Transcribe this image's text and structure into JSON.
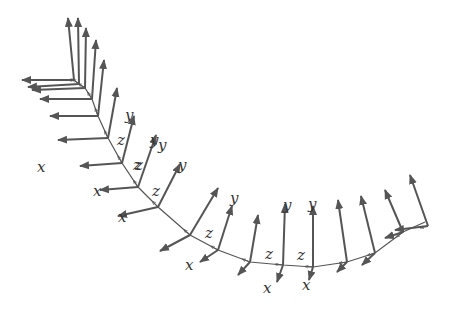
{
  "diagram": {
    "colors": {
      "stroke": "#555555",
      "label": "#333333",
      "background": "#ffffff"
    },
    "curve": [
      [
        74,
        80
      ],
      [
        79,
        84
      ],
      [
        85,
        88
      ],
      [
        92,
        99
      ],
      [
        98,
        116
      ],
      [
        108,
        138
      ],
      [
        122,
        163
      ],
      [
        138,
        187
      ],
      [
        158,
        207
      ],
      [
        190,
        235
      ],
      [
        218,
        250
      ],
      [
        250,
        262
      ],
      [
        283,
        265
      ],
      [
        313,
        267
      ],
      [
        347,
        262
      ],
      [
        375,
        253
      ],
      [
        403,
        232
      ],
      [
        425,
        222
      ]
    ],
    "frames": [
      {
        "o": [
          74,
          80
        ],
        "x": [
          22,
          80
        ],
        "y": [
          68,
          18
        ]
      },
      {
        "o": [
          79,
          84
        ],
        "x": [
          28,
          87
        ],
        "y": [
          78,
          18
        ]
      },
      {
        "o": [
          85,
          88
        ],
        "x": [
          32,
          90
        ],
        "y": [
          86,
          28
        ]
      },
      {
        "o": [
          92,
          99
        ],
        "x": [
          40,
          99
        ],
        "y": [
          96,
          40
        ]
      },
      {
        "o": [
          98,
          116
        ],
        "x": [
          50,
          116
        ],
        "y": [
          104,
          60
        ]
      },
      {
        "o": [
          108,
          138
        ],
        "x": [
          58,
          140
        ],
        "y": [
          117,
          88
        ]
      },
      {
        "o": [
          122,
          163
        ],
        "x": [
          80,
          166
        ],
        "y": [
          134,
          116
        ]
      },
      {
        "o": [
          138,
          187
        ],
        "x": [
          100,
          190
        ],
        "y": [
          156,
          135
        ]
      },
      {
        "o": [
          158,
          207
        ],
        "x": [
          118,
          216
        ],
        "y": [
          180,
          164
        ]
      },
      {
        "o": [
          190,
          235
        ],
        "x": [
          160,
          251
        ],
        "y": [
          218,
          188
        ]
      },
      {
        "o": [
          218,
          250
        ],
        "x": [
          200,
          262
        ],
        "y": [
          232,
          206
        ]
      },
      {
        "o": [
          250,
          262
        ],
        "x": [
          238,
          275
        ],
        "y": [
          258,
          215
        ]
      },
      {
        "o": [
          283,
          265
        ],
        "x": [
          277,
          282
        ],
        "y": [
          285,
          204
        ]
      },
      {
        "o": [
          313,
          267
        ],
        "x": [
          309,
          280
        ],
        "y": [
          313,
          206
        ]
      },
      {
        "o": [
          347,
          262
        ],
        "x": [
          337,
          272
        ],
        "y": [
          338,
          200
        ]
      },
      {
        "o": [
          375,
          253
        ],
        "x": [
          362,
          265
        ],
        "y": [
          361,
          196
        ]
      },
      {
        "o": [
          403,
          232
        ],
        "x": [
          385,
          238
        ],
        "y": [
          385,
          190
        ]
      },
      {
        "o": [
          428,
          226
        ],
        "x": [
          395,
          230
        ],
        "y": [
          410,
          175
        ]
      }
    ],
    "labels": [
      {
        "text": "y",
        "x": 125,
        "y": 120
      },
      {
        "text": "y",
        "x": 150,
        "y": 145
      },
      {
        "text": "z",
        "x": 117,
        "y": 145
      },
      {
        "text": "z",
        "x": 133,
        "y": 170
      },
      {
        "text": "x",
        "x": 37,
        "y": 172
      },
      {
        "text": "y",
        "x": 158,
        "y": 150
      },
      {
        "text": "z",
        "x": 135,
        "y": 170
      },
      {
        "text": "x",
        "x": 93,
        "y": 196
      },
      {
        "text": "y",
        "x": 178,
        "y": 170
      },
      {
        "text": "z",
        "x": 152,
        "y": 196
      },
      {
        "text": "x",
        "x": 118,
        "y": 222
      },
      {
        "text": "y",
        "x": 230,
        "y": 203
      },
      {
        "text": "z",
        "x": 205,
        "y": 238
      },
      {
        "text": "x",
        "x": 185,
        "y": 270
      },
      {
        "text": "y",
        "x": 283,
        "y": 210
      },
      {
        "text": "z",
        "x": 265,
        "y": 259
      },
      {
        "text": "x",
        "x": 263,
        "y": 293
      },
      {
        "text": "y",
        "x": 308,
        "y": 209
      },
      {
        "text": "z",
        "x": 297,
        "y": 260
      },
      {
        "text": "x",
        "x": 302,
        "y": 290
      }
    ]
  }
}
